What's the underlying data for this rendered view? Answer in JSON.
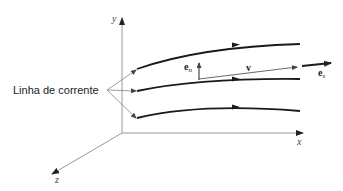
{
  "diagram": {
    "axes": {
      "x_label": "x",
      "y_label": "y",
      "z_label": "z"
    },
    "streamline_label": "Linha de corrente",
    "vectors": {
      "normal": {
        "symbol": "e",
        "subscript": "n"
      },
      "velocity": {
        "symbol": "v"
      },
      "tangential": {
        "symbol": "e",
        "subscript": "s"
      }
    },
    "colors": {
      "axis": "#999999",
      "streamline": "#1a1a1a",
      "text": "#222222"
    },
    "streamlines": [
      {
        "id": "top",
        "path": "M137,69 Q200,47 300,44"
      },
      {
        "id": "middle",
        "path": "M137,91 Q200,78 300,79"
      },
      {
        "id": "bottom",
        "path": "M137,118 Q200,103 300,111"
      }
    ]
  }
}
